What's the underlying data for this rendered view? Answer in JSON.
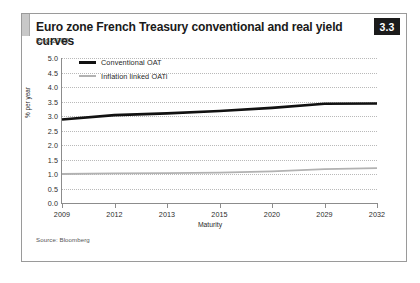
{
  "panel": {
    "title": "Euro zone French Treasury conventional and real yield curves",
    "subtitle": "End-2005",
    "badge": "3.3",
    "source": "Source: Bloomberg"
  },
  "colors": {
    "conventional": "#111111",
    "inflation_linked": "#b2b2b2",
    "grid": "#b9b9b9",
    "axis": "#8c8c8c",
    "badge_bg": "#1b1b1b"
  },
  "chart_data": {
    "type": "line",
    "title": "Euro zone French Treasury conventional and real yield curves",
    "subtitle": "End-2005",
    "xlabel": "Maturity",
    "ylabel": "% per year",
    "categories": [
      "2009",
      "2012",
      "2013",
      "2015",
      "2020",
      "2029",
      "2032"
    ],
    "ylim": [
      0.0,
      5.0
    ],
    "yticks": [
      "0.0",
      "0.5",
      "1.0",
      "1.5",
      "2.0",
      "2.5",
      "3.0",
      "3.5",
      "4.0",
      "4.5",
      "5.0"
    ],
    "grid": true,
    "legend_position": "top-left",
    "series": [
      {
        "name": "Conventional OAT",
        "color": "#111111",
        "values": [
          2.88,
          3.03,
          3.09,
          3.17,
          3.28,
          3.42,
          3.43
        ]
      },
      {
        "name": "Inflation linked OATi",
        "color": "#b2b2b2",
        "values": [
          1.0,
          1.02,
          1.03,
          1.05,
          1.09,
          1.17,
          1.2
        ]
      }
    ]
  }
}
